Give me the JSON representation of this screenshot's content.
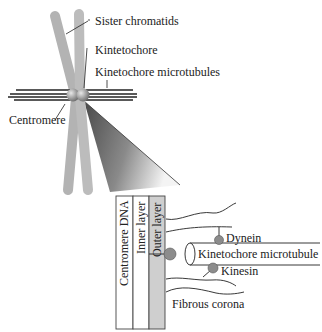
{
  "diagram": {
    "overview_labels": {
      "sister_chromatids": "Sister chromatids",
      "kinetochore": "Kintetochore",
      "kinetochore_microtubules": "Kinetochore microtubules",
      "centromere": "Centromere"
    },
    "detail_labels": {
      "centromere_dna": "Centromere DNA",
      "inner_layer": "Inner layer",
      "outer_layer": "Outer layer",
      "dynein": "Dynein",
      "kinetochore_microtubule": "Kinetochore microtubule",
      "kinesin": "Kinesin",
      "fibrous_corona": "Fibrous corona"
    },
    "colors": {
      "chromatid": "#b3b3b3",
      "kinetochore_sphere": "#9a9a9a",
      "microtubule_lines": "#222222",
      "cone_dark": "#555555",
      "outer_layer_fill": "#cfcfcf",
      "motor_protein": "#8c8c8c"
    }
  }
}
